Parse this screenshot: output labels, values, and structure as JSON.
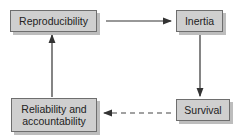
{
  "diagram": {
    "type": "flowchart-cycle",
    "nodes": [
      {
        "id": "reproducibility",
        "label": "Reproducibility"
      },
      {
        "id": "inertia",
        "label": "Inertia"
      },
      {
        "id": "survival",
        "label": "Survival"
      },
      {
        "id": "reliability",
        "label": "Reliability and accountability"
      }
    ],
    "edges": [
      {
        "from": "reproducibility",
        "to": "inertia",
        "style": "solid"
      },
      {
        "from": "inertia",
        "to": "survival",
        "style": "solid"
      },
      {
        "from": "survival",
        "to": "reliability",
        "style": "dashed"
      },
      {
        "from": "reliability",
        "to": "reproducibility",
        "style": "solid"
      }
    ],
    "colors": {
      "box_fill": "#cfcfcf",
      "box_border": "#6e6e6e",
      "shadow": "#bdbdbd",
      "arrow": "#333333"
    }
  }
}
